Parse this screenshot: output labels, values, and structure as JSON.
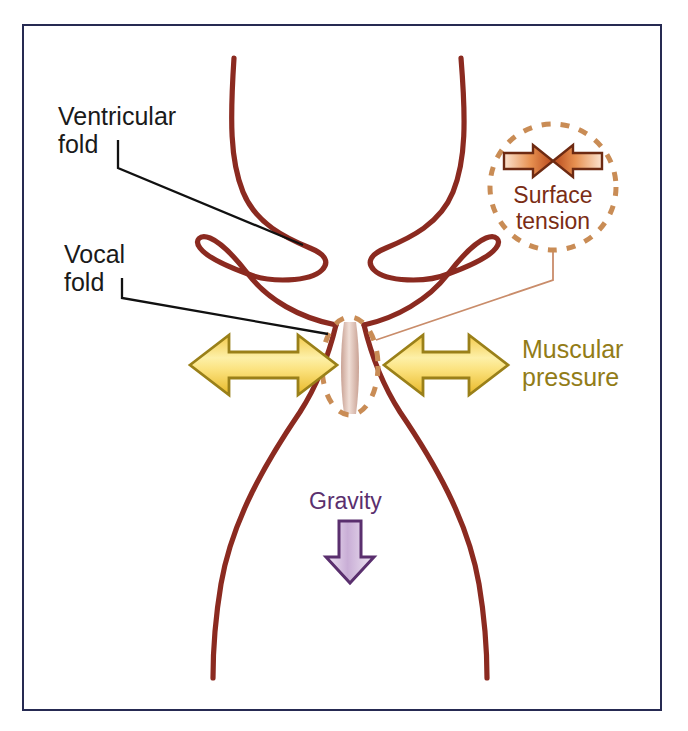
{
  "figure": {
    "background_color": "#ffffff",
    "frame_color": "#262a52"
  },
  "labels": {
    "ventricular_fold": "Ventricular\nfold",
    "vocal_fold": "Vocal\nfold",
    "surface_tension": "Surface\ntension",
    "muscular_pressure": "Muscular\npressure",
    "gravity": "Gravity"
  },
  "colors": {
    "anatomy_line": "#8b2a20",
    "leader_line": "#111111",
    "callout_dash": "#c98c55",
    "callout_text": "#7a2c14",
    "surface_arrow_outline": "#6d2a12",
    "surface_arrow_fill": "#e08a4a",
    "muscular_arrow_outline": "#9a8019",
    "muscular_arrow_fill": "#f6d76b",
    "muscular_text": "#927c17",
    "gravity_outline": "#5a2f6e",
    "gravity_fill": "#d9c4e2",
    "gravity_text": "#5a2f6e",
    "glottis_channel": "#d9b9ac",
    "thin_callout_leader": "#c98c6a"
  },
  "annotations": {
    "surface_tension_arrows": "two opposing horizontal arrows converging inward",
    "muscular_pressure_arrows": "two double-headed horizontal arrows, left and right of glottis",
    "gravity_arrow": "single downward arrow inside trachea"
  }
}
